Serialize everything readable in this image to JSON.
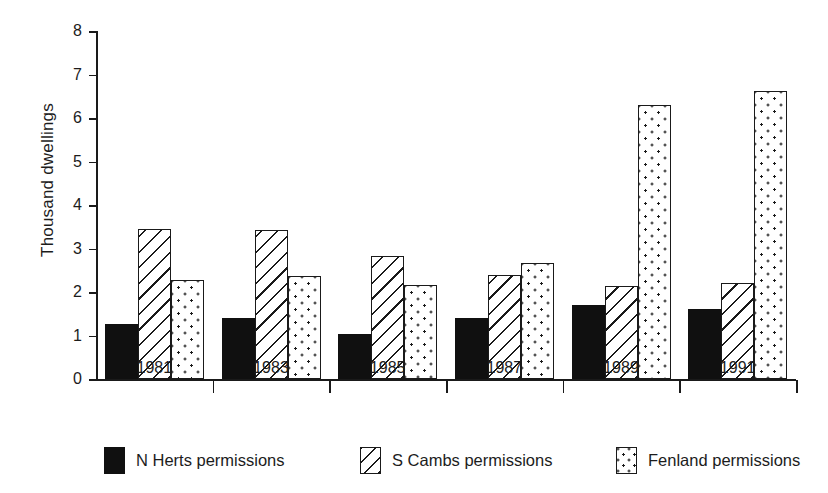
{
  "chart_data": {
    "type": "bar",
    "title": "",
    "subtitle": "",
    "xlabel": "",
    "ylabel": "Thousand dwellings",
    "categories": [
      "1981",
      "1983",
      "1985",
      "1987",
      "1989",
      "1991"
    ],
    "series": [
      {
        "name": "N Herts permissions",
        "pattern": "solid-black",
        "values": [
          1.27,
          1.4,
          1.04,
          1.4,
          1.7,
          1.62
        ]
      },
      {
        "name": "S Cambs permissions",
        "pattern": "diagonal-hatch",
        "values": [
          3.46,
          3.42,
          2.82,
          2.4,
          2.14,
          2.21
        ]
      },
      {
        "name": "Fenland permissions",
        "pattern": "dotted",
        "values": [
          2.27,
          2.36,
          2.16,
          2.66,
          6.31,
          6.63
        ]
      }
    ],
    "ylim": [
      0,
      8
    ],
    "ytick_labels": [
      "8",
      "7",
      "6",
      "5",
      "4",
      "3",
      "2",
      "1",
      "0"
    ],
    "ytick_values": [
      8,
      7,
      6,
      5,
      4,
      3,
      2,
      1,
      0
    ],
    "grid": false,
    "legend_position": "bottom",
    "bar_orientation": "vertical",
    "colors": {
      "ink": "#1a1a1a",
      "background": "#ffffff"
    }
  },
  "legend": {
    "items": [
      {
        "label": "N Herts permissions"
      },
      {
        "label": "S Cambs permissions"
      },
      {
        "label": "Fenland permissions"
      }
    ]
  }
}
